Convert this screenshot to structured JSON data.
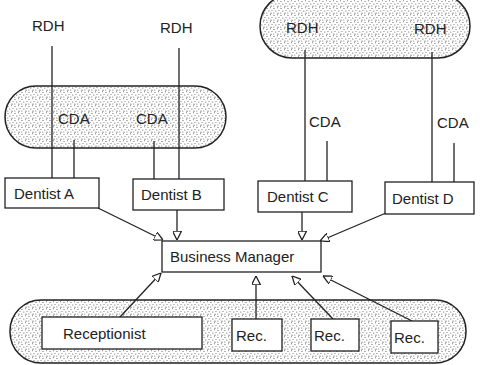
{
  "diagram": {
    "type": "organizational-flow",
    "colors": {
      "ink": "#222222",
      "stipple": "#555555",
      "background": "#ffffff"
    },
    "top_labels": {
      "rdh_a": "RDH",
      "rdh_b": "RDH",
      "rdh_c": "RDH",
      "rdh_d": "RDH",
      "cda_a": "CDA",
      "cda_b": "CDA",
      "cda_c": "CDA",
      "cda_d": "CDA"
    },
    "dentists": {
      "a": "Dentist A",
      "b": "Dentist B",
      "c": "Dentist C",
      "d": "Dentist D"
    },
    "manager": "Business Manager",
    "front_office": {
      "receptionist": "Receptionist",
      "rec_1": "Rec.",
      "rec_2": "Rec.",
      "rec_3": "Rec."
    },
    "groups": [
      {
        "name": "shared-cda-pool",
        "members": [
          "CDA",
          "CDA"
        ],
        "shaded": true
      },
      {
        "name": "shared-rdh-pool",
        "members": [
          "RDH",
          "RDH"
        ],
        "shaded": true
      },
      {
        "name": "reception-pool",
        "members": [
          "Receptionist",
          "Rec.",
          "Rec.",
          "Rec."
        ],
        "shaded": true
      }
    ],
    "edges": [
      {
        "from": "Dentist A",
        "to": "Business Manager"
      },
      {
        "from": "Dentist B",
        "to": "Business Manager"
      },
      {
        "from": "Dentist C",
        "to": "Business Manager"
      },
      {
        "from": "Dentist D",
        "to": "Business Manager"
      },
      {
        "from": "Receptionist",
        "to": "Business Manager"
      },
      {
        "from": "Rec.",
        "to": "Business Manager"
      },
      {
        "from": "Rec.",
        "to": "Business Manager"
      },
      {
        "from": "Rec.",
        "to": "Business Manager"
      }
    ]
  }
}
